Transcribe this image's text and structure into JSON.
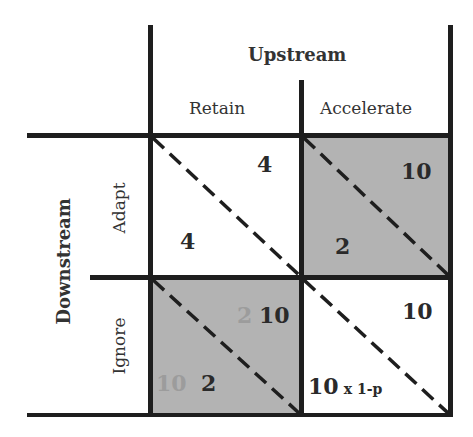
{
  "header": {
    "column_player": "Upstream",
    "columns": [
      "Retain",
      "Accelerate"
    ],
    "row_player": "Downstream",
    "rows": [
      "Adapt",
      "Ignore"
    ]
  },
  "cells": {
    "adapt_retain": {
      "upstream": "4",
      "downstream": "4",
      "shaded": false
    },
    "adapt_accelerate": {
      "upstream": "10",
      "downstream": "2",
      "shaded": true
    },
    "ignore_retain": {
      "upstream": "10",
      "upstream_ghost": "2",
      "downstream": "2",
      "downstream_ghost": "10",
      "shaded": true
    },
    "ignore_accelerate": {
      "upstream": "10",
      "downstream_main": "10",
      "downstream_suffix": "x 1-p",
      "shaded": false
    }
  },
  "colors": {
    "shade": "#b3b3b3",
    "line": "#1e1e1e",
    "ghost": "#9c9c9c"
  }
}
